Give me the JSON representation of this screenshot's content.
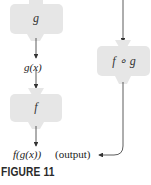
{
  "diagram": {
    "machines": [
      {
        "id": "g",
        "label": "g"
      },
      {
        "id": "f",
        "label": "f"
      },
      {
        "id": "composite",
        "label": "f ∘ g"
      }
    ],
    "intermediate_label": "g(x)",
    "output_label": "f(g(x))",
    "output_note": "(output)",
    "caption": "FIGURE 11",
    "colors": {
      "machine_fill": "#e6e6e6",
      "arrow": "#333333"
    }
  }
}
